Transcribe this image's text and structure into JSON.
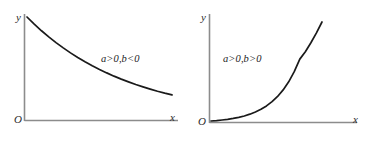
{
  "figure": {
    "background_color": "#ffffff",
    "axis_color": "#8c8c8c",
    "curve_color": "#1a1a1a",
    "text_color": "#2b2b2b"
  },
  "panels": [
    {
      "id": "left",
      "y_axis_label": "y",
      "origin_label": "O",
      "x_axis_label": "x",
      "annotation": "a>0,b<0"
    },
    {
      "id": "right",
      "y_axis_label": "y",
      "origin_label": "O",
      "x_axis_label": "x",
      "annotation": "a>0,b>0"
    }
  ],
  "chart_data": [
    {
      "type": "line",
      "title": "",
      "subtitle": "",
      "xlabel": "x",
      "ylabel": "y",
      "annotations": [
        "a>0,b<0"
      ],
      "legend": [],
      "grid": false,
      "xlim": [
        0,
        1
      ],
      "ylim": [
        0,
        1
      ],
      "x_ticks": [],
      "y_ticks": [],
      "description": "Exponential decay curve y = a*e^(b*x) with a>0 and b<0; starts high on the y-axis and decreases, concave up, approaching the x-axis asymptotically.",
      "series": [
        {
          "name": "y = a*e^(bx), b<0",
          "x": [
            0.0,
            0.05,
            0.1,
            0.15,
            0.2,
            0.25,
            0.3,
            0.35,
            0.4,
            0.45,
            0.5,
            0.55,
            0.6,
            0.65,
            0.7,
            0.75,
            0.8,
            0.85,
            0.9,
            0.95,
            1.0
          ],
          "y": [
            1.0,
            0.93,
            0.865,
            0.805,
            0.749,
            0.697,
            0.648,
            0.603,
            0.561,
            0.522,
            0.486,
            0.452,
            0.42,
            0.391,
            0.364,
            0.338,
            0.315,
            0.293,
            0.272,
            0.253,
            0.236
          ]
        }
      ]
    },
    {
      "type": "line",
      "title": "",
      "subtitle": "",
      "xlabel": "x",
      "ylabel": "y",
      "annotations": [
        "a>0,b>0"
      ],
      "legend": [],
      "grid": false,
      "xlim": [
        0,
        1
      ],
      "ylim": [
        0,
        1
      ],
      "x_ticks": [],
      "y_ticks": [],
      "description": "Exponential growth curve y = a*e^(b*x) with a>0 and b>0; starts near zero at the origin and rises steeply, concave up.",
      "series": [
        {
          "name": "y = a*e^(bx), b>0",
          "x": [
            0.0,
            0.05,
            0.1,
            0.15,
            0.2,
            0.25,
            0.3,
            0.35,
            0.4,
            0.45,
            0.5,
            0.55,
            0.6,
            0.65,
            0.7,
            0.75,
            0.8,
            0.85,
            0.9,
            0.95,
            1.0
          ],
          "y": [
            0.0,
            0.004,
            0.01,
            0.017,
            0.026,
            0.037,
            0.051,
            0.069,
            0.091,
            0.118,
            0.152,
            0.195,
            0.248,
            0.314,
            0.396,
            0.498,
            0.625,
            0.7,
            0.79,
            0.89,
            1.0
          ]
        }
      ]
    }
  ]
}
